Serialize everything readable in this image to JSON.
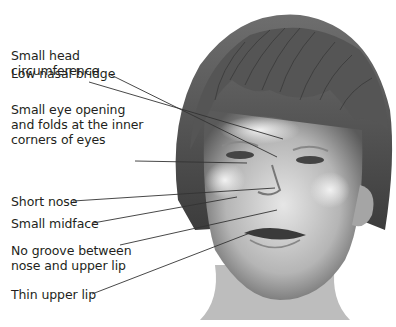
{
  "diagram": {
    "labels": [
      {
        "id": "head",
        "text": "Small head\ncircumference",
        "top": 48
      },
      {
        "id": "nasal",
        "text": "Low nasal bridge",
        "top": 67
      },
      {
        "id": "eye",
        "text": "Small eye opening\nand folds at the inner\ncorners of eyes",
        "top": 102
      },
      {
        "id": "nose",
        "text": "Short nose",
        "top": 168
      },
      {
        "id": "midface",
        "text": "Small midface",
        "top": 190
      },
      {
        "id": "groove",
        "text": "No groove between\nnose and upper lip",
        "top": 216
      },
      {
        "id": "lip",
        "text": "Thin upper lip",
        "top": 250
      }
    ]
  }
}
